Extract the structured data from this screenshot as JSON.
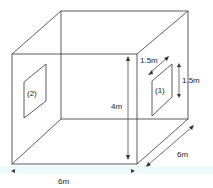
{
  "diagram": {
    "labels": {
      "window1": "(1)",
      "window2": "(2)",
      "height": "4m",
      "width_bottom": "6m",
      "depth": "6m",
      "window1_width": "1.5m",
      "window1_height": "1.5m"
    },
    "colors": {
      "line": "#333333",
      "floor_band_light": "#dff4f7",
      "dimension_gradient_start": "#59c7d9",
      "dimension_gradient_end": "#e0407a"
    }
  }
}
